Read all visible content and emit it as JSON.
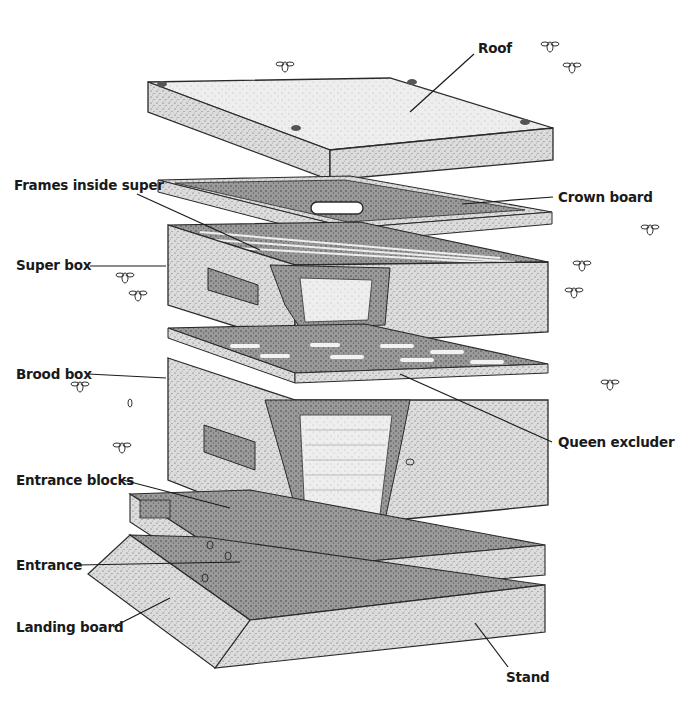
{
  "diagram": {
    "labels": {
      "roof": "Roof",
      "crown_board": "Crown board",
      "frames_inside_super": "Frames inside super",
      "super_box": "Super box",
      "brood_box": "Brood box",
      "queen_excluder": "Queen excluder",
      "entrance_blocks": "Entrance blocks",
      "entrance": "Entrance",
      "landing_board": "Landing board",
      "stand": "Stand"
    },
    "colors": {
      "background": "#ffffff",
      "wood_light": "#e4e4e4",
      "wood_mid": "#c9c9c9",
      "wood_dark": "#8f8f8f",
      "shadow": "#4a4a4a",
      "outline": "#2a2a2a",
      "label_text": "#1a1a1a"
    }
  }
}
